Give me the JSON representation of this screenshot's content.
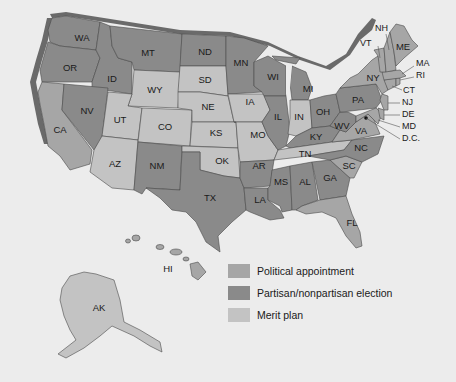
{
  "colors": {
    "background": "#ececec",
    "political_appointment": "#a6a6a6",
    "election": "#8a8a8a",
    "merit_plan": "#c3c3c3",
    "border": "#4a4a4a",
    "coast_shadow": "#6a6a6a"
  },
  "legend": {
    "items": [
      {
        "key": "political_appointment",
        "label": "Political appointment",
        "color": "#a6a6a6"
      },
      {
        "key": "election",
        "label": "Partisan/nonpartisan election",
        "color": "#8a8a8a"
      },
      {
        "key": "merit_plan",
        "label": "Merit plan",
        "color": "#c3c3c3"
      }
    ]
  },
  "states": {
    "WA": {
      "label": "WA",
      "category": "election"
    },
    "OR": {
      "label": "OR",
      "category": "election"
    },
    "CA": {
      "label": "CA",
      "category": "political_appointment"
    },
    "ID": {
      "label": "ID",
      "category": "election"
    },
    "NV": {
      "label": "NV",
      "category": "election"
    },
    "MT": {
      "label": "MT",
      "category": "election"
    },
    "WY": {
      "label": "WY",
      "category": "merit_plan"
    },
    "UT": {
      "label": "UT",
      "category": "merit_plan"
    },
    "AZ": {
      "label": "AZ",
      "category": "merit_plan"
    },
    "CO": {
      "label": "CO",
      "category": "merit_plan"
    },
    "NM": {
      "label": "NM",
      "category": "election"
    },
    "ND": {
      "label": "ND",
      "category": "election"
    },
    "SD": {
      "label": "SD",
      "category": "merit_plan"
    },
    "NE": {
      "label": "NE",
      "category": "merit_plan"
    },
    "KS": {
      "label": "KS",
      "category": "merit_plan"
    },
    "OK": {
      "label": "OK",
      "category": "merit_plan"
    },
    "TX": {
      "label": "TX",
      "category": "election"
    },
    "MN": {
      "label": "MN",
      "category": "election"
    },
    "IA": {
      "label": "IA",
      "category": "merit_plan"
    },
    "MO": {
      "label": "MO",
      "category": "merit_plan"
    },
    "AR": {
      "label": "AR",
      "category": "election"
    },
    "LA": {
      "label": "LA",
      "category": "election"
    },
    "WI": {
      "label": "WI",
      "category": "election"
    },
    "IL": {
      "label": "IL",
      "category": "election"
    },
    "MI": {
      "label": "MI",
      "category": "election"
    },
    "IN": {
      "label": "IN",
      "category": "merit_plan"
    },
    "OH": {
      "label": "OH",
      "category": "election"
    },
    "KY": {
      "label": "KY",
      "category": "election"
    },
    "TN": {
      "label": "TN",
      "category": "merit_plan"
    },
    "MS": {
      "label": "MS",
      "category": "election"
    },
    "AL": {
      "label": "AL",
      "category": "election"
    },
    "GA": {
      "label": "GA",
      "category": "election"
    },
    "FL": {
      "label": "FL",
      "category": "political_appointment"
    },
    "SC": {
      "label": "SC",
      "category": "political_appointment"
    },
    "NC": {
      "label": "NC",
      "category": "election"
    },
    "VA": {
      "label": "VA",
      "category": "political_appointment"
    },
    "WV": {
      "label": "WV",
      "category": "election"
    },
    "PA": {
      "label": "PA",
      "category": "election"
    },
    "NY": {
      "label": "NY",
      "category": "political_appointment"
    },
    "VT": {
      "label": "VT",
      "category": "political_appointment"
    },
    "NH": {
      "label": "NH",
      "category": "political_appointment"
    },
    "ME": {
      "label": "ME",
      "category": "political_appointment"
    },
    "MA": {
      "label": "MA",
      "category": "political_appointment"
    },
    "RI": {
      "label": "RI",
      "category": "political_appointment"
    },
    "CT": {
      "label": "CT",
      "category": "political_appointment"
    },
    "NJ": {
      "label": "NJ",
      "category": "political_appointment"
    },
    "DE": {
      "label": "DE",
      "category": "political_appointment"
    },
    "MD": {
      "label": "MD",
      "category": "political_appointment"
    },
    "DC": {
      "label": "D.C.",
      "category": "political_appointment"
    },
    "AK": {
      "label": "AK",
      "category": "merit_plan"
    },
    "HI": {
      "label": "HI",
      "category": "political_appointment"
    }
  }
}
